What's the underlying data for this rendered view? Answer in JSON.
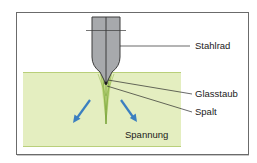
{
  "diagram": {
    "labels": {
      "wheel": "Stahlrad",
      "dust": "Glasstaub",
      "gap": "Spalt",
      "stress": "Spannung"
    },
    "colors": {
      "glass": "#e4eec0",
      "glass_edge": "#b9cf7a",
      "tool": "#a7a9ac",
      "tool_edge": "#3c3c3c",
      "arrow": "#3b7fc0",
      "frame": "#6b6b6b",
      "crack": "#6a9a2a"
    }
  }
}
